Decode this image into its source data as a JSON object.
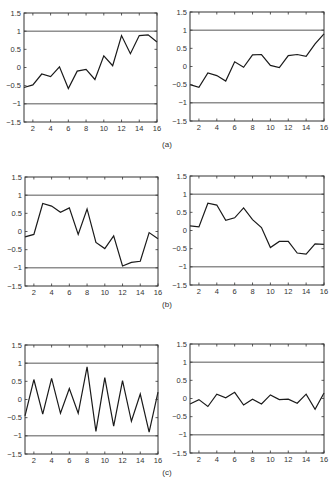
{
  "figure": {
    "captions": [
      {
        "label": "(a)",
        "x": 167,
        "y": 140
      },
      {
        "label": "(b)",
        "x": 167,
        "y": 300
      },
      {
        "label": "(c)",
        "x": 167,
        "y": 468
      }
    ],
    "style": {
      "line_color": "#1a1a1a",
      "ref_line_color": "#444444",
      "axis_color": "#333333"
    }
  },
  "chart_data": [
    {
      "id": "a-left",
      "panel": "(a)",
      "type": "line",
      "box": {
        "left": 24,
        "top": 13,
        "right": 157,
        "bottom": 122
      },
      "x": [
        1,
        2,
        3,
        4,
        5,
        6,
        7,
        8,
        9,
        10,
        11,
        12,
        13,
        14,
        15,
        16
      ],
      "values": [
        -0.55,
        -0.48,
        -0.18,
        -0.25,
        0.02,
        -0.58,
        -0.1,
        -0.05,
        -0.33,
        0.32,
        0.05,
        0.88,
        0.38,
        0.88,
        0.9,
        0.7
      ],
      "xlim": [
        1,
        16
      ],
      "ylim": [
        -1.5,
        1.5
      ],
      "xticks": [
        2,
        4,
        6,
        8,
        10,
        12,
        14,
        16
      ],
      "yticks": [
        1.5,
        1,
        0.5,
        0,
        -0.5,
        -1,
        -1.5
      ],
      "ytick_labels": [
        "1.5",
        "1",
        "0.5",
        "0",
        "−0.5",
        "−1",
        "−1.5"
      ],
      "reference_lines": [
        1,
        -1
      ],
      "title": "",
      "xlabel": "",
      "ylabel": ""
    },
    {
      "id": "a-right",
      "panel": "(a)",
      "type": "line",
      "box": {
        "left": 190,
        "top": 12,
        "right": 324,
        "bottom": 121
      },
      "x": [
        1,
        2,
        3,
        4,
        5,
        6,
        7,
        8,
        9,
        10,
        11,
        12,
        13,
        14,
        15,
        16
      ],
      "values": [
        -0.5,
        -0.57,
        -0.18,
        -0.25,
        -0.4,
        0.13,
        -0.02,
        0.32,
        0.33,
        0.03,
        -0.03,
        0.3,
        0.33,
        0.28,
        0.62,
        0.9
      ],
      "xlim": [
        1,
        16
      ],
      "ylim": [
        -1.5,
        1.5
      ],
      "xticks": [
        2,
        4,
        6,
        8,
        10,
        12,
        14,
        16
      ],
      "yticks": [
        1.5,
        1,
        0.5,
        0,
        -0.5,
        -1,
        -1.5
      ],
      "ytick_labels": [
        "1.5",
        "1",
        "0.5",
        "0",
        "−0.5",
        "−1",
        "−1.5"
      ],
      "reference_lines": [
        1,
        -1
      ],
      "title": "",
      "xlabel": "",
      "ylabel": ""
    },
    {
      "id": "b-left",
      "panel": "(b)",
      "type": "line",
      "box": {
        "left": 25,
        "top": 177,
        "right": 158,
        "bottom": 286
      },
      "x": [
        1,
        2,
        3,
        4,
        5,
        6,
        7,
        8,
        9,
        10,
        11,
        12,
        13,
        14,
        15,
        16
      ],
      "values": [
        -0.15,
        -0.08,
        0.77,
        0.7,
        0.53,
        0.65,
        -0.08,
        0.62,
        -0.3,
        -0.47,
        -0.12,
        -0.95,
        -0.85,
        -0.82,
        -0.03,
        -0.2
      ],
      "xlim": [
        1,
        16
      ],
      "ylim": [
        -1.5,
        1.5
      ],
      "xticks": [
        2,
        4,
        6,
        8,
        10,
        12,
        14,
        16
      ],
      "yticks": [
        1.5,
        1,
        0.5,
        0,
        -0.5,
        -1,
        -1.5
      ],
      "ytick_labels": [
        "1.5",
        "1",
        "0.5",
        "0",
        "−0.5",
        "−1",
        "−1.5"
      ],
      "reference_lines": [
        1,
        -1
      ],
      "title": "",
      "xlabel": "",
      "ylabel": ""
    },
    {
      "id": "b-right",
      "panel": "(b)",
      "type": "line",
      "box": {
        "left": 190,
        "top": 176,
        "right": 324,
        "bottom": 285
      },
      "x": [
        1,
        2,
        3,
        4,
        5,
        6,
        7,
        8,
        9,
        10,
        11,
        12,
        13,
        14,
        15,
        16
      ],
      "values": [
        0.13,
        0.1,
        0.75,
        0.7,
        0.28,
        0.35,
        0.62,
        0.3,
        0.08,
        -0.47,
        -0.3,
        -0.3,
        -0.62,
        -0.65,
        -0.37,
        -0.38
      ],
      "xlim": [
        1,
        16
      ],
      "ylim": [
        -1.5,
        1.5
      ],
      "xticks": [
        2,
        4,
        6,
        8,
        10,
        12,
        14,
        16
      ],
      "yticks": [
        1.5,
        1,
        0.5,
        0,
        -0.5,
        -1,
        -1.5
      ],
      "ytick_labels": [
        "1.5",
        "1",
        "0.5",
        "0",
        "−0.5",
        "−1",
        "−1.5"
      ],
      "reference_lines": [
        1,
        -1
      ],
      "title": "",
      "xlabel": "",
      "ylabel": ""
    },
    {
      "id": "c-left",
      "panel": "(c)",
      "type": "line",
      "box": {
        "left": 25,
        "top": 345,
        "right": 158,
        "bottom": 454
      },
      "x": [
        1,
        2,
        3,
        4,
        5,
        6,
        7,
        8,
        9,
        10,
        11,
        12,
        13,
        14,
        15,
        16
      ],
      "values": [
        -0.45,
        0.55,
        -0.4,
        0.58,
        -0.38,
        0.3,
        -0.38,
        0.9,
        -0.88,
        0.6,
        -0.73,
        0.52,
        -0.6,
        0.15,
        -0.9,
        0.2
      ],
      "xlim": [
        1,
        16
      ],
      "ylim": [
        -1.5,
        1.5
      ],
      "xticks": [
        2,
        4,
        6,
        8,
        10,
        12,
        14,
        16
      ],
      "yticks": [
        1.5,
        1,
        0.5,
        0,
        -0.5,
        -1,
        -1.5
      ],
      "ytick_labels": [
        "1.5",
        "1",
        "0.5",
        "0",
        "−0.5",
        "−1",
        "−1.5"
      ],
      "reference_lines": [
        1,
        -1
      ],
      "title": "",
      "xlabel": "",
      "ylabel": ""
    },
    {
      "id": "c-right",
      "panel": "(c)",
      "type": "line",
      "box": {
        "left": 190,
        "top": 344,
        "right": 324,
        "bottom": 453
      },
      "x": [
        1,
        2,
        3,
        4,
        5,
        6,
        7,
        8,
        9,
        10,
        11,
        12,
        13,
        14,
        15,
        16
      ],
      "values": [
        -0.15,
        -0.03,
        -0.22,
        0.12,
        0.02,
        0.17,
        -0.18,
        -0.02,
        -0.15,
        0.1,
        -0.03,
        -0.02,
        -0.13,
        0.12,
        -0.3,
        0.15
      ],
      "xlim": [
        1,
        16
      ],
      "ylim": [
        -1.5,
        1.5
      ],
      "xticks": [
        2,
        4,
        6,
        8,
        10,
        12,
        14,
        16
      ],
      "yticks": [
        1.5,
        1,
        0.5,
        0,
        -0.5,
        -1,
        -1.5
      ],
      "ytick_labels": [
        "1.5",
        "1",
        "0.5",
        "0",
        "−0.5",
        "−1",
        "−1.5"
      ],
      "reference_lines": [
        1,
        -1
      ],
      "title": "",
      "xlabel": "",
      "ylabel": ""
    }
  ]
}
